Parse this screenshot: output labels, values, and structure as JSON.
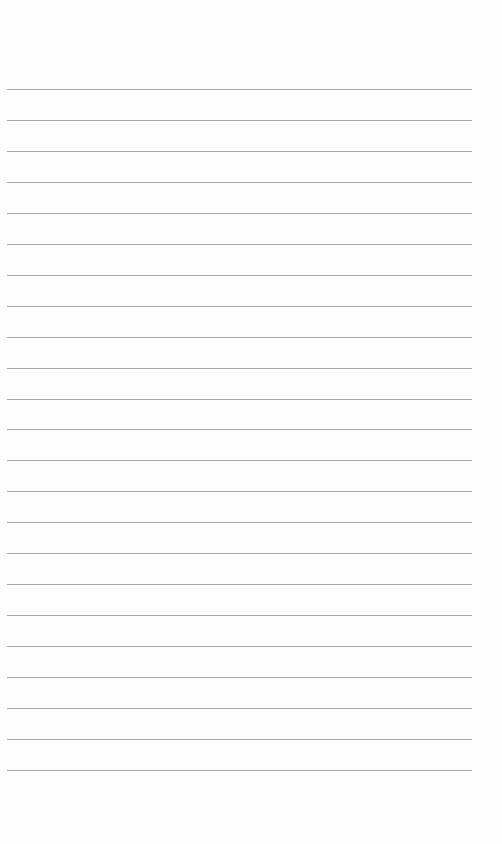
{
  "document": {
    "type": "lined-paper",
    "rule_count": 23,
    "rule_color": "#a8a8a8",
    "paper_color": "#fefefe",
    "text": ""
  }
}
